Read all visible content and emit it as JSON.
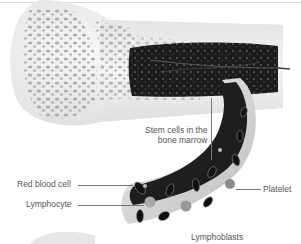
{
  "diagram": {
    "labels": {
      "stem_cells": [
        "Stem cells in the",
        "bone marrow"
      ],
      "red_blood_cell": "Red blood cell",
      "lymphocyte": "Lymphocyte",
      "platelet": "Platelet",
      "lymphoblasts": "Lymphoblasts"
    },
    "colors": {
      "bone": "#eeeeee",
      "bone_pores": "#9a9a9a",
      "marrow": "#1e1e1e",
      "vessel": "#2a2a2a",
      "label_text": "#555555",
      "leader_line": "#777777"
    }
  }
}
